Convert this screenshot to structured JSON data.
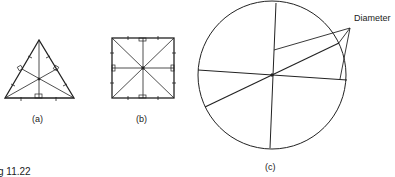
{
  "figure": {
    "caption": "g 11.22",
    "panels": [
      {
        "id": "a",
        "label": "(a)",
        "shape": "equilateral-triangle"
      },
      {
        "id": "b",
        "label": "(b)",
        "shape": "square"
      },
      {
        "id": "c",
        "label": "(c)",
        "shape": "circle",
        "annotation": "Diameter"
      }
    ]
  }
}
